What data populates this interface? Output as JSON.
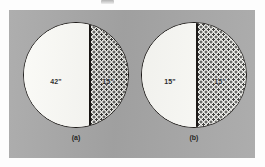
{
  "figure": {
    "panel_color": "#a8a8a8",
    "line_color": "#14110f",
    "clear_fill_color": "#fcfcf8",
    "dotted_fill_color": "#f2f2ee",
    "dot_color": "#3a3a38"
  },
  "diagrams": [
    {
      "id": "a",
      "caption": "(a)",
      "shape": "circle",
      "divider": "vertical-chord",
      "regions": [
        {
          "name": "left-clear-region",
          "fill": "clear",
          "label": "42\""
        },
        {
          "name": "right-dotted-region",
          "fill": "dotted",
          "label": "15\""
        }
      ]
    },
    {
      "id": "b",
      "caption": "(b)",
      "shape": "circle",
      "divider": "vertical-chord",
      "regions": [
        {
          "name": "left-clear-region",
          "fill": "clear",
          "label": "15\""
        },
        {
          "name": "right-dotted-region",
          "fill": "dotted",
          "label": "15\""
        }
      ]
    }
  ]
}
